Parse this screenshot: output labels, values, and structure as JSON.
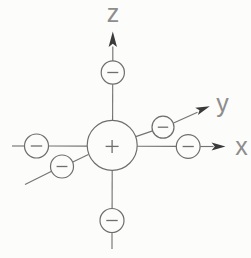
{
  "figure": {
    "type": "physics-diagram",
    "background": "#fcfcfa",
    "colors": {
      "line": "#747474",
      "circle_stroke": "#6e6e6e",
      "circle_fill": "#fcfcfa",
      "arrowhead": "#3a3a3a",
      "label": "#8d8d8d"
    },
    "axes": [
      {
        "id": "x",
        "label": "x"
      },
      {
        "id": "y",
        "label": "y"
      },
      {
        "id": "z",
        "label": "z"
      }
    ],
    "central_charge": {
      "symbol": "+",
      "polarity": "positive"
    },
    "negative_charges": {
      "symbol": "−",
      "count": 6,
      "positions": [
        "+z",
        "-z",
        "+x",
        "-x",
        "+y",
        "-y"
      ]
    }
  }
}
